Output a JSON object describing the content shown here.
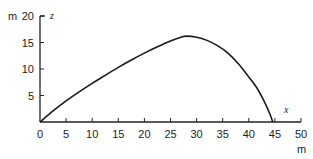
{
  "chart_data": {
    "type": "line",
    "title": "",
    "xlabel": "x",
    "ylabel": "z",
    "x_unit": "m",
    "y_unit": "m",
    "xlim": [
      0,
      50
    ],
    "ylim": [
      0,
      20
    ],
    "xticks": [
      0,
      5,
      10,
      15,
      20,
      25,
      30,
      35,
      40,
      45,
      50
    ],
    "yticks": [
      5,
      10,
      15,
      20
    ],
    "xtick_labels": [
      "0",
      "5",
      "10",
      "15",
      "20",
      "25",
      "30",
      "35",
      "40",
      "45",
      "50"
    ],
    "ytick_labels": [
      "5",
      "10",
      "15",
      "20"
    ],
    "grid": false,
    "legend": "none",
    "series": [
      {
        "name": "trajectory",
        "color": "#1a1a1a",
        "x": [
          0,
          2.5,
          5,
          7.5,
          10,
          12.5,
          15,
          17.5,
          20,
          22.5,
          25,
          27,
          28,
          30,
          32,
          34,
          36,
          38,
          40,
          41.5,
          43,
          44,
          44.6
        ],
        "y": [
          0,
          2.1,
          4.0,
          5.7,
          7.3,
          8.8,
          10.3,
          11.7,
          13.0,
          14.2,
          15.3,
          16.0,
          16.2,
          16.0,
          15.4,
          14.4,
          13.0,
          11.0,
          8.5,
          6.5,
          3.8,
          1.6,
          0
        ]
      }
    ]
  }
}
